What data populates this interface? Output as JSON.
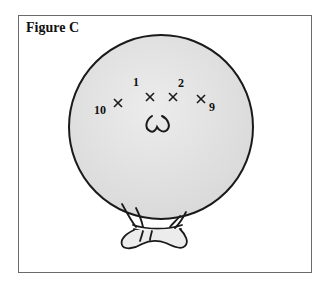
{
  "figure": {
    "title": "Figure C",
    "markers": [
      {
        "label": "1",
        "x": 150,
        "y": 97,
        "label_x": 135,
        "label_y": 86
      },
      {
        "label": "2",
        "x": 173,
        "y": 97,
        "label_x": 179,
        "label_y": 87
      },
      {
        "label": "9",
        "x": 201,
        "y": 99,
        "label_x": 209,
        "label_y": 110
      },
      {
        "label": "10",
        "x": 118,
        "y": 103,
        "label_x": 95,
        "label_y": 115
      }
    ],
    "colors": {
      "balloon_fill": "#e3e3e3",
      "outline": "#1a1a1a",
      "frame": "#6a6a6a"
    }
  }
}
